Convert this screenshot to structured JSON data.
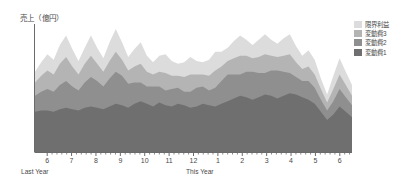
{
  "chart_data": {
    "type": "area",
    "stacked": true,
    "title": "",
    "ylabel": "売上（億円）",
    "xlabel": "",
    "grid": false,
    "legend_position": "top-right",
    "axis": {
      "x_major_ticks": [
        "6",
        "7",
        "8",
        "9",
        "10",
        "11",
        "12",
        "1",
        "2",
        "3",
        "4",
        "5",
        "6"
      ],
      "x_minor_ticks_per_major": 4,
      "y_range": [
        0,
        100
      ],
      "y_tick_labels": []
    },
    "period_labels": [
      {
        "text": "Last Year",
        "at_tick": "6"
      },
      {
        "text": "This Year",
        "at_tick": "1"
      }
    ],
    "x": [
      0,
      1,
      2,
      3,
      4,
      5,
      6,
      7,
      8,
      9,
      10,
      11,
      12,
      13,
      14,
      15,
      16,
      17,
      18,
      19,
      20,
      21,
      22,
      23,
      24,
      25,
      26,
      27,
      28,
      29,
      30,
      31,
      32,
      33,
      34,
      35,
      36,
      37,
      38,
      39,
      40,
      41,
      42,
      43,
      44,
      45,
      46,
      47,
      48,
      49,
      50,
      51
    ],
    "series": [
      {
        "name": "変動費1",
        "color": "#6f6f6f",
        "order": 1,
        "values": [
          30,
          31,
          31,
          30,
          32,
          33,
          32,
          31,
          33,
          34,
          33,
          32,
          34,
          36,
          35,
          33,
          36,
          38,
          36,
          34,
          37,
          35,
          34,
          36,
          35,
          33,
          34,
          36,
          35,
          34,
          36,
          38,
          40,
          42,
          41,
          39,
          41,
          43,
          42,
          40,
          42,
          44,
          43,
          41,
          39,
          36,
          30,
          24,
          28,
          34,
          30,
          26
        ]
      },
      {
        "name": "変動費2",
        "color": "#8f8f8f",
        "order": 2,
        "values": [
          12,
          14,
          16,
          15,
          18,
          20,
          17,
          15,
          19,
          22,
          20,
          17,
          21,
          24,
          22,
          18,
          16,
          14,
          13,
          15,
          12,
          11,
          13,
          12,
          10,
          12,
          14,
          13,
          11,
          14,
          17,
          20,
          18,
          16,
          19,
          21,
          18,
          16,
          19,
          21,
          18,
          15,
          13,
          12,
          14,
          12,
          9,
          7,
          10,
          13,
          11,
          9
        ]
      },
      {
        "name": "変動費3",
        "color": "#b4b4b4",
        "order": 3,
        "values": [
          10,
          12,
          14,
          13,
          16,
          18,
          15,
          12,
          14,
          16,
          13,
          11,
          13,
          15,
          12,
          10,
          12,
          14,
          11,
          9,
          11,
          13,
          10,
          9,
          11,
          13,
          10,
          9,
          11,
          13,
          11,
          10,
          12,
          14,
          12,
          10,
          12,
          14,
          11,
          10,
          12,
          14,
          11,
          9,
          11,
          10,
          8,
          6,
          9,
          11,
          9,
          7
        ]
      },
      {
        "name": "限界利益",
        "color": "#dcdcdc",
        "order": 4,
        "values": [
          8,
          10,
          12,
          11,
          14,
          16,
          13,
          10,
          12,
          15,
          12,
          10,
          14,
          17,
          13,
          10,
          13,
          16,
          12,
          9,
          12,
          14,
          11,
          9,
          11,
          13,
          10,
          9,
          12,
          14,
          11,
          10,
          13,
          15,
          12,
          10,
          13,
          15,
          12,
          10,
          13,
          15,
          12,
          10,
          12,
          11,
          8,
          6,
          10,
          12,
          10,
          8
        ]
      }
    ],
    "legend_entries": [
      {
        "label": "限界利益",
        "color": "#dcdcdc"
      },
      {
        "label": "変動費3",
        "color": "#b4b4b4"
      },
      {
        "label": "変動費2",
        "color": "#8f8f8f"
      },
      {
        "label": "変動費1",
        "color": "#6f6f6f"
      }
    ],
    "colors": {
      "axis": "#6b6b6b",
      "text": "#4a4a4a",
      "background": "#ffffff"
    }
  }
}
